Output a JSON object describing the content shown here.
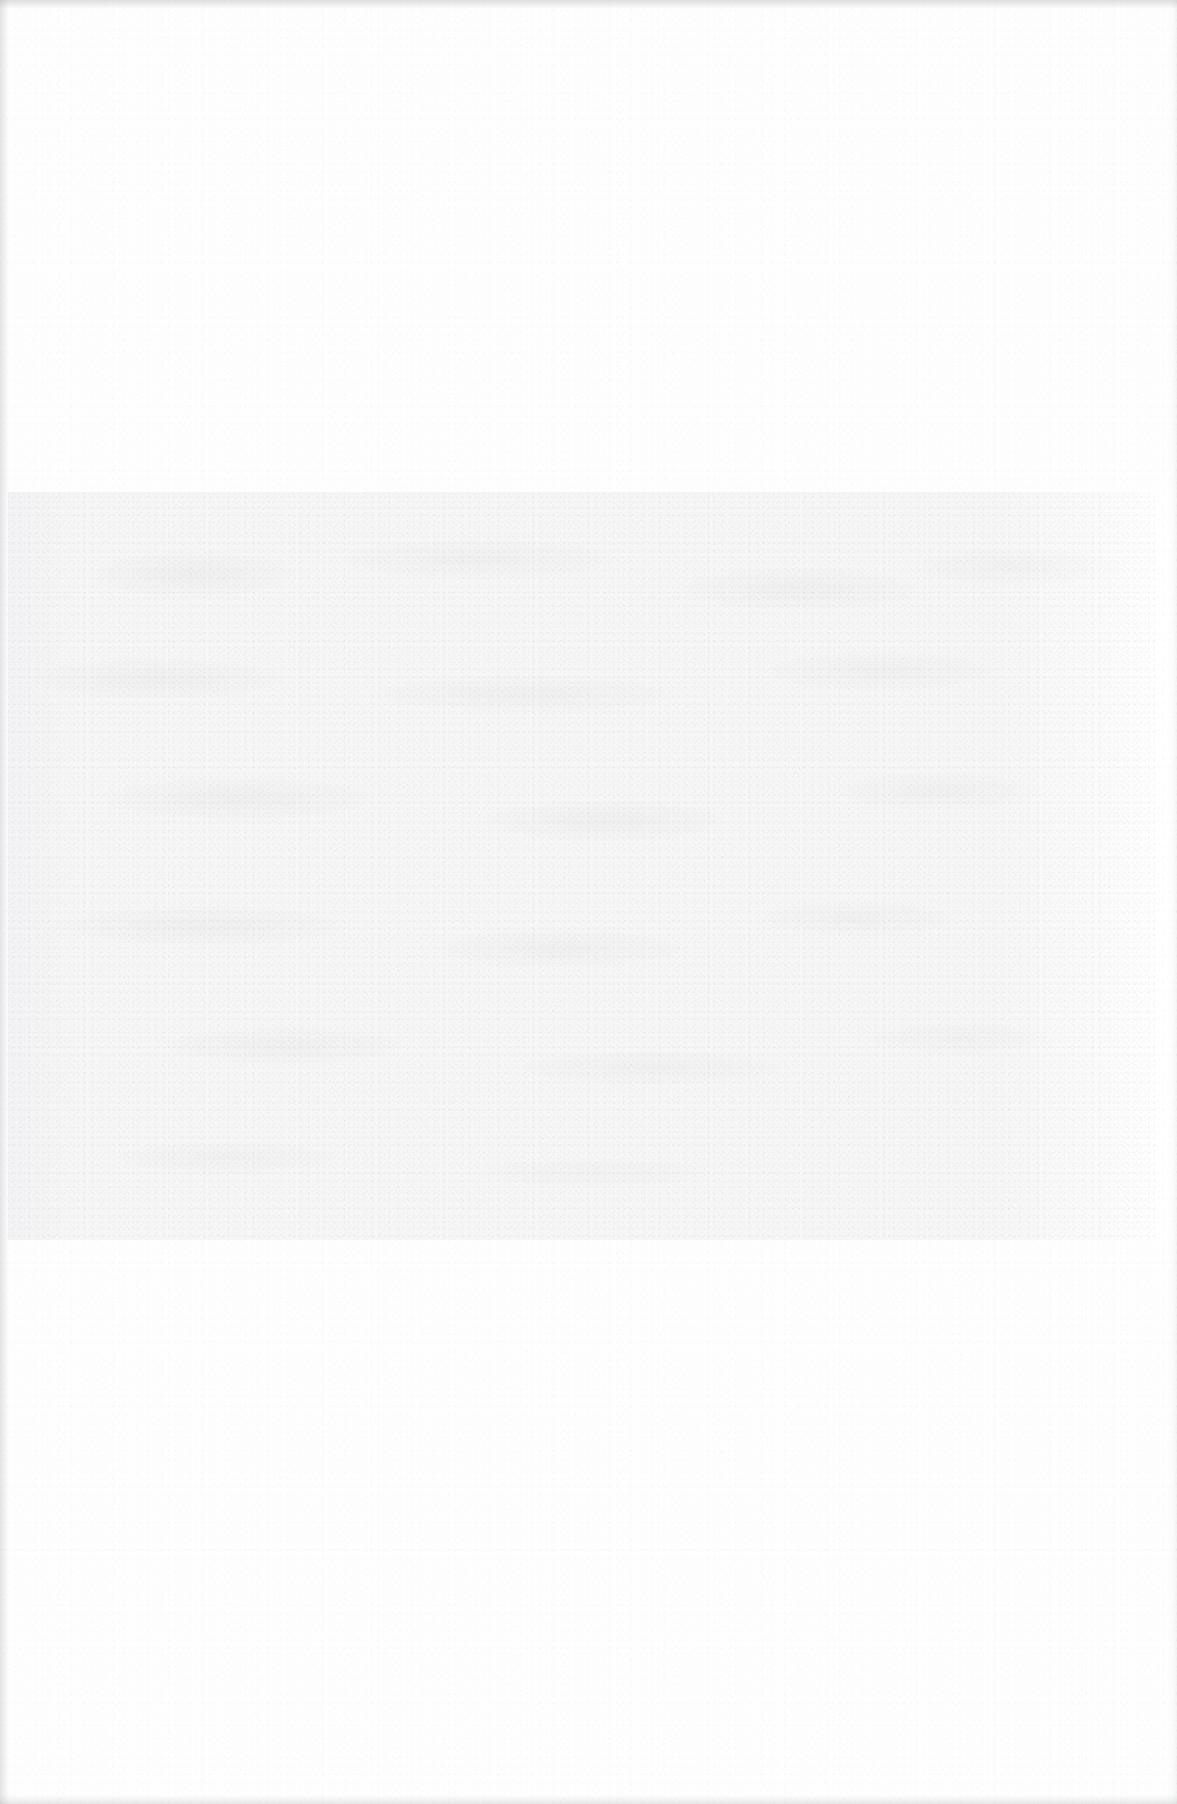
{
  "page": {
    "width_px": 1177,
    "height_px": 1804,
    "background_color": "#ffffff",
    "media": "scanned paper sheet",
    "legible_text": "",
    "condition_note": "Page is blank to the eye — overexposed / faded scan with no legible text or graphics."
  },
  "regions": {
    "margin_top": {
      "label": "",
      "top_px": 0,
      "height_px": 492,
      "tone_hex": "#fefefe"
    },
    "content_band": {
      "label": "",
      "left_px": 8,
      "top_px": 492,
      "width_px": 1147,
      "height_px": 748,
      "tone_hex": "#f6f6f7",
      "description": "Faded horizontal band of residual ink; mottling suggests former text blocks but no character is readable."
    },
    "margin_bottom": {
      "label": "",
      "top_px": 1240,
      "height_px": 564,
      "tone_hex": "#fefefe"
    }
  },
  "artifacts": {
    "edge_top": {
      "label": "",
      "tone_hex": "#96989e"
    },
    "edge_left": {
      "label": "",
      "tone_hex": "#96989e"
    },
    "edge_bottom": {
      "label": "",
      "tone_hex": "#96989e"
    },
    "edge_right": {
      "label": "",
      "tone_hex": "#96989e"
    }
  }
}
